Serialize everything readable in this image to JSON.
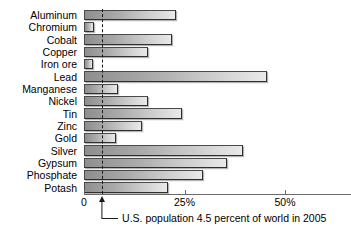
{
  "chart_data": {
    "type": "bar",
    "orientation": "horizontal",
    "title": "",
    "xlabel": "",
    "ylabel": "",
    "xlim": [
      0,
      53
    ],
    "grid": false,
    "legend": null,
    "categories": [
      "Aluminum",
      "Chromium",
      "Cobalt",
      "Copper",
      "Iron ore",
      "Lead",
      "Manganese",
      "Nickel",
      "Tin",
      "Zinc",
      "Gold",
      "Silver",
      "Gypsum",
      "Phosphate",
      "Potash"
    ],
    "values": [
      23,
      2.5,
      22,
      16,
      2.2,
      45.5,
      8.5,
      16,
      24.5,
      14.5,
      8,
      39.5,
      35.5,
      29.5,
      21
    ],
    "xticks": [
      0,
      25,
      50
    ],
    "xtick_labels": [
      "0",
      "25%",
      "50%"
    ],
    "reference_line": {
      "value": 4.5,
      "style": "dashed",
      "label": "U.S. population 4.5 percent of world in 2005"
    }
  },
  "colors": {
    "bar_fill_dark": "#8e8e8e",
    "bar_fill_light": "#e9e9e9",
    "bar_border": "#4a4a4a",
    "axis": "#6b6b6b",
    "reference": "#1a1a1a",
    "text": "#000000",
    "background": "#ffffff"
  }
}
